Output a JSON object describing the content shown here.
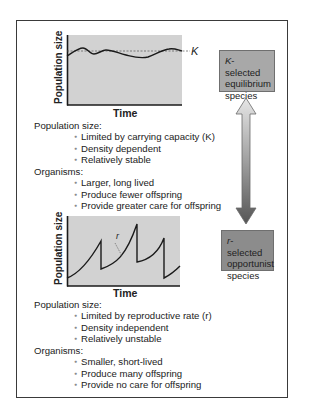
{
  "k_selected": {
    "box_label_italic": "K",
    "box_label_rest": "-selected equilibrium species",
    "box_color": "#a8a8a8",
    "chart": {
      "ylabel": "Population size",
      "xlabel": "Time",
      "line_label": "K"
    },
    "population_size": {
      "title": "Population size:",
      "items": [
        "Limited by carrying capacity (K)",
        "Density dependent",
        "Relatively stable"
      ]
    },
    "organisms": {
      "title": "Organisms:",
      "items": [
        "Larger, long lived",
        "Produce fewer offspring",
        "Provide greater care for offspring"
      ]
    }
  },
  "r_selected": {
    "box_label_italic": "r",
    "box_label_rest": "-selected opportunist species",
    "box_color": "#8c8c8c",
    "chart": {
      "ylabel": "Population size",
      "xlabel": "Time",
      "curve_label": "r"
    },
    "population_size": {
      "title": "Population size:",
      "items": [
        "Limited by reproductive rate (r)",
        "Density independent",
        "Relatively unstable"
      ]
    },
    "organisms": {
      "title": "Organisms:",
      "items": [
        "Smaller, short-lived",
        "Produce many offspring",
        "Provide no care for offspring"
      ]
    }
  },
  "arrow": {
    "direction": "bidirectional-vertical",
    "gradient_top": "#e6e6e6",
    "gradient_bottom": "#555555"
  },
  "colors": {
    "plot_background": "#d2d2d2",
    "curve": "#1a1a1a",
    "frame_border": "#3a3a3a"
  }
}
